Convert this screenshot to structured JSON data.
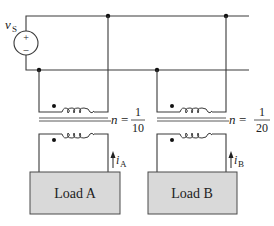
{
  "source": {
    "label_main": "v",
    "label_sub": "S",
    "plus": "+",
    "minus": "–"
  },
  "transformers": [
    {
      "id": "A",
      "ratio_var": "n",
      "equals": "=",
      "numerator": "1",
      "denominator": "10"
    },
    {
      "id": "B",
      "ratio_var": "n",
      "equals": "=",
      "numerator": "1",
      "denominator": "20"
    }
  ],
  "currents": [
    {
      "main": "i",
      "sub": "A"
    },
    {
      "main": "i",
      "sub": "B"
    }
  ],
  "loads": [
    {
      "label": "Load A"
    },
    {
      "label": "Load B"
    }
  ],
  "colors": {
    "load_fill": "#d9d9d9",
    "wire": "#3a3a3a",
    "background": "#ffffff"
  }
}
